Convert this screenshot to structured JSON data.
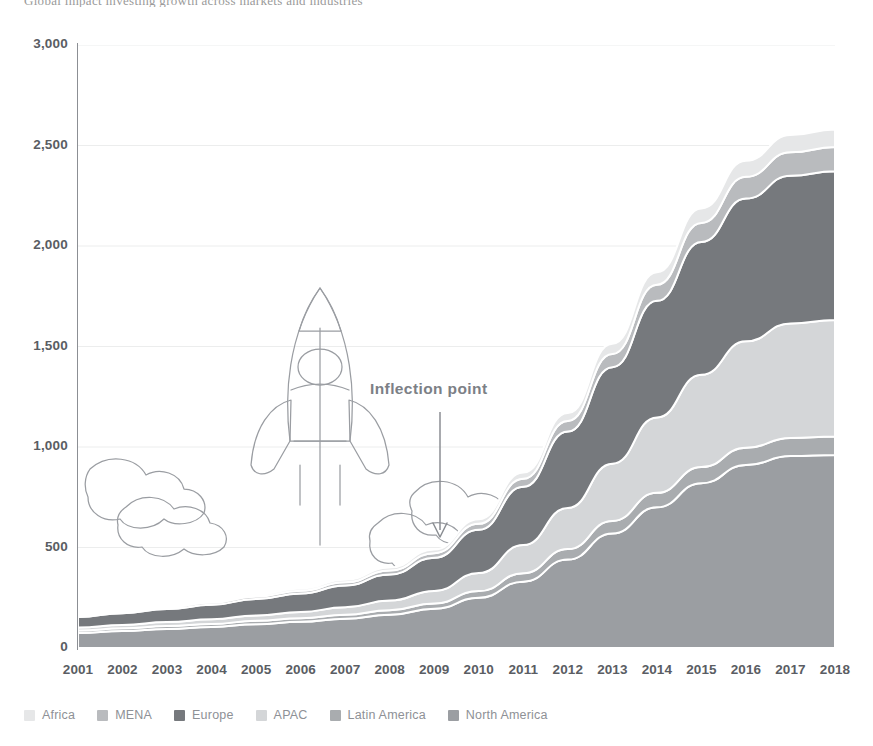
{
  "page": {
    "cropped_header_text": "Global impact investing growth across markets and industries"
  },
  "annotation": {
    "label": "Inflection point",
    "icon": "down-arrow-icon",
    "at_year": "2009"
  },
  "illustration": {
    "name": "rocket-launch-illustration",
    "parts": [
      "rocket-body",
      "rocket-nose",
      "rocket-window",
      "rocket-fins",
      "exhaust-lines",
      "cloud-left",
      "cloud-right"
    ],
    "stroke": "#9a9da2"
  },
  "legend": {
    "position": "bottom-left",
    "items": [
      {
        "label": "Africa",
        "color": "#e6e7e8",
        "icon": "legend-swatch-africa"
      },
      {
        "label": "MENA",
        "color": "#b9bbbe",
        "icon": "legend-swatch-mena"
      },
      {
        "label": "Europe",
        "color": "#76797d",
        "icon": "legend-swatch-europe"
      },
      {
        "label": "APAC",
        "color": "#d4d6d8",
        "icon": "legend-swatch-apac"
      },
      {
        "label": "Latin America",
        "color": "#a9acaf",
        "icon": "legend-swatch-latin-america"
      },
      {
        "label": "North America",
        "color": "#9b9ea2",
        "icon": "legend-swatch-north-america"
      }
    ]
  },
  "chart_data": {
    "type": "area",
    "stacked": true,
    "title": "",
    "subtitle": "",
    "xlabel": "",
    "ylabel": "",
    "grid": true,
    "grid_axis": "y",
    "legend_position": "bottom",
    "ylim": [
      0,
      3000
    ],
    "yticks": [
      0,
      500,
      1000,
      1500,
      2000,
      2500,
      3000
    ],
    "ytick_labels": [
      "0",
      "500",
      "1,000",
      "1,500",
      "2,000",
      "2,500",
      "3,000"
    ],
    "categories": [
      "2001",
      "2002",
      "2003",
      "2004",
      "2005",
      "2006",
      "2007",
      "2008",
      "2009",
      "2010",
      "2011",
      "2012",
      "2013",
      "2014",
      "2015",
      "2016",
      "2017",
      "2018"
    ],
    "stack_order_bottom_to_top": [
      "North America",
      "Latin America",
      "APAC",
      "Europe",
      "MENA",
      "Africa"
    ],
    "series": [
      {
        "name": "North America",
        "color": "#9b9ea2",
        "values": [
          75,
          85,
          95,
          105,
          118,
          130,
          145,
          165,
          195,
          250,
          330,
          440,
          570,
          700,
          820,
          910,
          955,
          960
        ]
      },
      {
        "name": "Latin America",
        "color": "#a9acaf",
        "values": [
          12,
          13,
          14,
          15,
          17,
          18,
          20,
          23,
          27,
          33,
          42,
          52,
          62,
          72,
          80,
          86,
          90,
          92
        ]
      },
      {
        "name": "APAC",
        "color": "#d4d6d8",
        "values": [
          15,
          17,
          20,
          23,
          27,
          31,
          38,
          48,
          62,
          90,
          140,
          205,
          285,
          375,
          460,
          530,
          570,
          580
        ]
      },
      {
        "name": "Europe",
        "color": "#76797d",
        "values": [
          52,
          58,
          65,
          72,
          82,
          92,
          108,
          130,
          165,
          215,
          290,
          380,
          480,
          580,
          660,
          710,
          735,
          740
        ]
      },
      {
        "name": "MENA",
        "color": "#b9bbbe",
        "values": [
          8,
          9,
          10,
          11,
          12,
          14,
          16,
          19,
          23,
          30,
          40,
          52,
          66,
          80,
          95,
          108,
          116,
          120
        ]
      },
      {
        "name": "Africa",
        "color": "#e6e7e8",
        "values": [
          6,
          7,
          8,
          9,
          10,
          11,
          13,
          15,
          18,
          23,
          31,
          40,
          51,
          62,
          72,
          80,
          86,
          88
        ]
      }
    ],
    "totals": [
      168,
      189,
      212,
      235,
      266,
      296,
      340,
      400,
      490,
      641,
      873,
      1169,
      1514,
      1869,
      2187,
      2424,
      2552,
      2580
    ],
    "annotations": [
      {
        "text": "Inflection point",
        "x": "2009",
        "type": "arrow-down"
      }
    ]
  }
}
